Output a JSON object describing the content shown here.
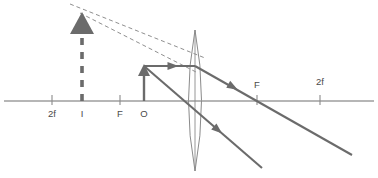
{
  "axis": {
    "y": 101,
    "x_start": 4,
    "x_end": 374
  },
  "labels": {
    "left_2f": "2f",
    "image_point": "I",
    "left_f": "F",
    "object_point": "O",
    "right_f": "F",
    "right_2f": "2f"
  },
  "points": {
    "left_2f_x": 52,
    "image_x": 82,
    "left_f_x": 120,
    "object_x": 144,
    "lens_x": 195,
    "right_f_x": 257,
    "right_2f_x": 320
  },
  "label_positions": {
    "left_2f": {
      "x": 52,
      "y": 117
    },
    "image_point": {
      "x": 82,
      "y": 117
    },
    "left_f": {
      "x": 120,
      "y": 117
    },
    "object_point": {
      "x": 144,
      "y": 117
    },
    "right_f": {
      "x": 257,
      "y": 88
    },
    "right_2f": {
      "x": 320,
      "y": 85
    }
  },
  "object_arrow": {
    "x": 144,
    "base_y": 101,
    "tip_y": 64,
    "head_half_width": 6,
    "head_height": 12,
    "style": "solid",
    "description": "object arrow pointing up at O"
  },
  "image_arrow": {
    "x": 82,
    "base_y": 101,
    "tip_y": 12,
    "head_half_width": 12,
    "head_height": 22,
    "style": "dashed-shaft-solid-head",
    "description": "virtual image arrow pointing up at I, enlarged"
  },
  "lens": {
    "center_x": 195,
    "top_y": 30,
    "bottom_y": 171,
    "bulge": 13,
    "description": "biconvex converging lens"
  },
  "rays": [
    {
      "name": "parallel-ray-incident",
      "style": "solid",
      "from": {
        "x": 144,
        "y": 66
      },
      "to": {
        "x": 195,
        "y": 66
      },
      "arrow_at": {
        "x": 173,
        "y": 66
      },
      "arrow_angle": 0
    },
    {
      "name": "parallel-ray-refracted",
      "style": "solid",
      "from": {
        "x": 195,
        "y": 66
      },
      "to": {
        "x": 352,
        "y": 155
      },
      "arrow_at": {
        "x": 233,
        "y": 87
      },
      "arrow_angle": 29.5
    },
    {
      "name": "center-ray",
      "style": "solid",
      "from": {
        "x": 144,
        "y": 66
      },
      "to": {
        "x": 262,
        "y": 168
      },
      "arrow_at": {
        "x": 218,
        "y": 130
      },
      "arrow_angle": 40.8
    },
    {
      "name": "virtual-ray-upper",
      "style": "dashed",
      "from": {
        "x": 70,
        "y": 4
      },
      "to": {
        "x": 205,
        "y": 58
      },
      "arrow_at": null,
      "arrow_angle": 0
    },
    {
      "name": "virtual-ray-lower",
      "style": "dashed",
      "from": {
        "x": 80,
        "y": 13
      },
      "to": {
        "x": 196,
        "y": 72
      },
      "arrow_at": null,
      "arrow_angle": 0
    }
  ],
  "colors": {
    "ray": "#6b6b6b",
    "axis": "#6e6e6e",
    "lens": "#8a8a8a",
    "dashed": "#8f8f8f",
    "label": "#4a4a4a",
    "background": "#ffffff"
  }
}
